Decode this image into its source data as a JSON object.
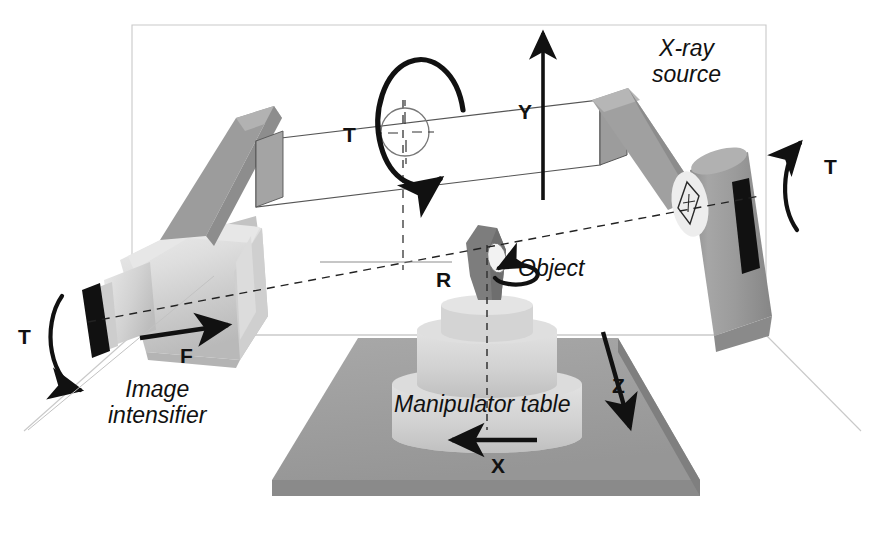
{
  "diagram": {
    "background_color": "#ffffff"
  },
  "colors": {
    "arm_gray": "#9a9a9a",
    "arm_gray_dark": "#8a8a8a",
    "detector_light": "#d8d8d8",
    "detector_mid": "#c6c6c6",
    "object_dark": "#7d7d7d",
    "base_gray": "#9e9e9e",
    "base_gray_dark": "#8d8d8d",
    "table_light": "#d5d5d5",
    "black": "#111111",
    "room_line": "#c9c9c9",
    "panel_stroke": "#555555"
  },
  "labels": {
    "xray_source": {
      "line1": "X-ray",
      "line2": "source"
    },
    "image_intensifier": {
      "line1": "Image",
      "line2": "intensifier"
    },
    "object": "Object",
    "manipulator_table": "Manipulator table"
  },
  "axes": [
    {
      "id": "t-right",
      "label": "T",
      "motion": "rotation",
      "description": "X-ray source tilt rotation about the horizontal beam axis"
    },
    {
      "id": "t-left",
      "label": "T",
      "motion": "rotation",
      "description": "Image intensifier tilt rotation about the horizontal beam axis"
    },
    {
      "id": "t-center",
      "label": "T",
      "motion": "rotation",
      "description": "C-arm rotation about the vertical column"
    },
    {
      "id": "y",
      "label": "Y",
      "motion": "translation",
      "description": "Vertical travel of the C-arm"
    },
    {
      "id": "f",
      "label": "F",
      "motion": "translation",
      "description": "Image intensifier focus / source-detector distance travel"
    },
    {
      "id": "r",
      "label": "R",
      "motion": "rotation",
      "description": "Object rotation on the manipulator"
    },
    {
      "id": "z",
      "label": "Z",
      "motion": "translation",
      "description": "Depth travel of the manipulator table"
    },
    {
      "id": "x",
      "label": "X",
      "motion": "translation",
      "description": "Lateral travel of the manipulator table"
    }
  ],
  "components": [
    {
      "id": "xray-source",
      "name": "X-ray source"
    },
    {
      "id": "image-intensifier",
      "name": "Image intensifier"
    },
    {
      "id": "object",
      "name": "Object"
    },
    {
      "id": "manipulator-table",
      "name": "Manipulator table"
    },
    {
      "id": "c-arm",
      "name": "C-arm"
    },
    {
      "id": "base-platform",
      "name": "Base platform"
    },
    {
      "id": "room-box",
      "name": "Room bounding box"
    }
  ]
}
